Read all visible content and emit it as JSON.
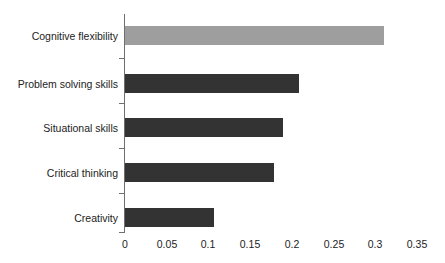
{
  "chart_data": {
    "type": "bar",
    "orientation": "horizontal",
    "title": "",
    "xlabel": "",
    "ylabel": "",
    "categories": [
      "Cognitive flexibility",
      "Problem solving skills",
      "Situational skills",
      "Critical thinking",
      "Creativity"
    ],
    "values": [
      0.311,
      0.208,
      0.189,
      0.179,
      0.107
    ],
    "colors": [
      "#9e9e9e",
      "#333333",
      "#333333",
      "#333333",
      "#333333"
    ],
    "xlim": [
      0,
      0.35
    ],
    "ylim": [
      0,
      5
    ],
    "xticks": [
      0,
      0.05,
      0.1,
      0.15,
      0.2,
      0.25,
      0.3,
      0.35
    ],
    "xticklabels": [
      "0",
      "0.05",
      "0.1",
      "0.15",
      "0.2",
      "0.25",
      "0.3",
      "0.35"
    ],
    "grid": false,
    "legend": null,
    "legend_position": "none",
    "axis_color": "#6f6f6f",
    "background": "#ffffff"
  },
  "axis": {
    "tick_0": "0",
    "tick_1": "0.05",
    "tick_2": "0.1",
    "tick_3": "0.15",
    "tick_4": "0.2",
    "tick_5": "0.25",
    "tick_6": "0.3",
    "tick_7": "0.35"
  },
  "labels": {
    "cat_0": "Cognitive flexibility",
    "cat_1": "Problem solving skills",
    "cat_2": "Situational skills",
    "cat_3": "Critical thinking",
    "cat_4": "Creativity"
  }
}
